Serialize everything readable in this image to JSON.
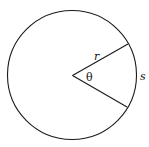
{
  "diagram": {
    "type": "circle-sector",
    "circle": {
      "cx": 72,
      "cy": 75,
      "r": 64.5
    },
    "radius_upper_end": {
      "x": 128,
      "y": 44
    },
    "radius_lower_end": {
      "x": 127,
      "y": 107
    },
    "labels": {
      "radius": "r",
      "angle": "θ",
      "arc": "s"
    },
    "stroke_color": "#1a1a1a",
    "background": "#ffffff"
  }
}
